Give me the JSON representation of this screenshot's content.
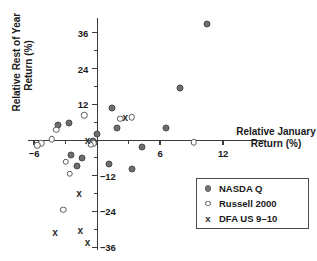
{
  "chart_data": {
    "type": "scatter",
    "title": "",
    "xlabel": "Relative January Return (%)",
    "ylabel": "Relative Rest of Year Return (%)",
    "xlim": [
      -8.5,
      14
    ],
    "ylim": [
      -38,
      40
    ],
    "xticks": [
      -6,
      0,
      6,
      12
    ],
    "xticklabels": [
      "-6",
      "",
      "6",
      "12"
    ],
    "yticks": [
      36,
      24,
      12,
      0,
      -12,
      -24,
      -36
    ],
    "yticklabels": [
      "36",
      "24",
      "12",
      "",
      "-12",
      "-24",
      "-36"
    ],
    "grid": false,
    "legend_position": "bottom-right",
    "series": [
      {
        "name": "NASDA Q",
        "marker": "filled-circle",
        "color": "#6e6e6e",
        "points": [
          [
            10.5,
            39.0
          ],
          [
            7.9,
            17.5
          ],
          [
            1.4,
            10.9
          ],
          [
            -3.7,
            5.0
          ],
          [
            -2.7,
            5.8
          ],
          [
            1.9,
            3.9
          ],
          [
            6.6,
            4.1
          ],
          [
            0.0,
            2.0
          ],
          [
            -0.4,
            -0.5
          ],
          [
            -2.5,
            -5.2
          ],
          [
            -1.4,
            -5.9
          ],
          [
            4.3,
            -2.3
          ],
          [
            -1.9,
            -8.9
          ],
          [
            1.1,
            -8.0
          ],
          [
            3.3,
            -9.8
          ]
        ]
      },
      {
        "name": "Russell 2000",
        "marker": "open-circle",
        "color": "#5a5a5a",
        "points": [
          [
            -1.2,
            8.4
          ],
          [
            2.2,
            7.2
          ],
          [
            3.3,
            7.6
          ],
          [
            -3.9,
            3.4
          ],
          [
            -4.3,
            0.3
          ],
          [
            -5.3,
            -1.1
          ],
          [
            -5.7,
            -1.7
          ],
          [
            -0.3,
            -1.1
          ],
          [
            -0.6,
            -1.6
          ],
          [
            -3.0,
            -7.3
          ],
          [
            -2.6,
            -11.3
          ],
          [
            -3.2,
            -23.5
          ],
          [
            9.2,
            -0.8
          ]
        ]
      },
      {
        "name": "DFA US 9–10",
        "marker": "x",
        "color": "#2a2a2a",
        "points": [
          [
            2.7,
            7.5
          ],
          [
            -0.9,
            -0.4
          ],
          [
            -1.7,
            -18.0
          ],
          [
            -1.6,
            -30.5
          ],
          [
            -4.0,
            -31.2
          ],
          [
            -0.9,
            -34.6
          ]
        ]
      }
    ]
  },
  "legend": {
    "items": [
      {
        "label": "NASDA Q",
        "marker": "filled-circle"
      },
      {
        "label": "Russell 2000",
        "marker": "open-circle"
      },
      {
        "label": "DFA US 9–10",
        "marker": "x"
      }
    ]
  },
  "axes": {
    "x_title": "Relative January Return (%)",
    "x_title_line1": "Relative January",
    "x_title_line2": "Return (%)",
    "y_title_line1": "Relative Rest of Year",
    "y_title_line2": "Return (%)"
  }
}
